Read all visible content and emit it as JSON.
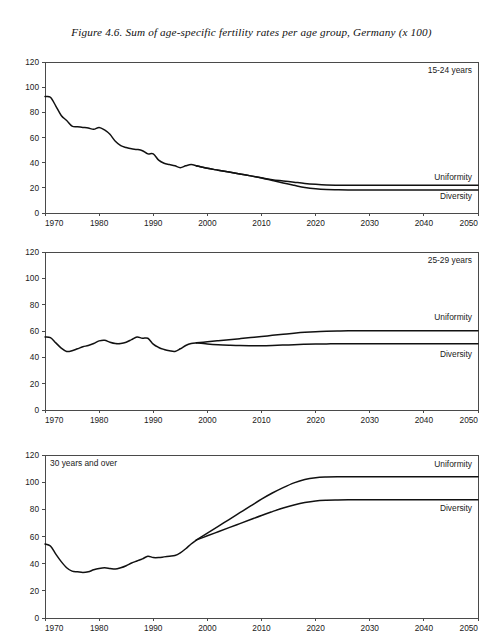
{
  "figure": {
    "title": "Figure 4.6.  Sum of age-specific fertility rates per age group, Germany (x 100)",
    "background_color": "#ffffff",
    "line_color": "#111111",
    "axis_color": "#4a4a4a"
  },
  "chart_data": [
    {
      "type": "line",
      "title": "15-24 years",
      "panel_label": "15-24 years",
      "panel_label_position": "top-right",
      "xlabel": "",
      "ylabel": "",
      "xlim": [
        1970,
        2050
      ],
      "ylim": [
        0,
        120
      ],
      "ytick_labels": [
        "0",
        "20",
        "40",
        "60",
        "80",
        "100",
        "120"
      ],
      "yticks": [
        0,
        20,
        40,
        60,
        80,
        100,
        120
      ],
      "xtick_labels": [
        "1970",
        "1980",
        "1990",
        "2000",
        "2010",
        "2020",
        "2030",
        "2040",
        "2050"
      ],
      "xticks": [
        1970,
        1980,
        1990,
        2000,
        2010,
        2020,
        2030,
        2040,
        2050
      ],
      "grid": false,
      "legend_position": "inline-right",
      "series": [
        {
          "name": "Historical",
          "label": "",
          "x": [
            1970,
            1971,
            1972,
            1973,
            1974,
            1975,
            1976,
            1977,
            1978,
            1979,
            1980,
            1981,
            1982,
            1983,
            1984,
            1985,
            1986,
            1987,
            1988,
            1989,
            1990,
            1991,
            1992,
            1993,
            1994,
            1995,
            1996,
            1997,
            1998
          ],
          "values": [
            92.5,
            92.0,
            85.0,
            77.5,
            73.5,
            69.0,
            68.5,
            68.0,
            67.5,
            66.5,
            68.0,
            66.0,
            62.5,
            57.0,
            53.5,
            52.0,
            51.0,
            50.5,
            49.5,
            47.0,
            47.0,
            42.0,
            39.5,
            38.5,
            37.5,
            36.0,
            37.5,
            38.5,
            37.5
          ]
        },
        {
          "name": "Uniformity",
          "label": "Uniformity",
          "x": [
            1998,
            2000,
            2002,
            2004,
            2006,
            2008,
            2010,
            2012,
            2014,
            2016,
            2018,
            2020,
            2022,
            2024,
            2026,
            2030,
            2040,
            2050
          ],
          "values": [
            37.5,
            35.5,
            34.0,
            32.5,
            31.0,
            29.5,
            28.0,
            26.5,
            25.5,
            24.5,
            23.5,
            22.8,
            22.3,
            22.1,
            22.0,
            22.0,
            22.0,
            22.0
          ]
        },
        {
          "name": "Diversity",
          "label": "Diversity",
          "x": [
            1998,
            2000,
            2002,
            2004,
            2006,
            2008,
            2010,
            2012,
            2014,
            2016,
            2018,
            2020,
            2022,
            2024,
            2026,
            2030,
            2040,
            2050
          ],
          "values": [
            37.5,
            35.5,
            34.0,
            32.5,
            31.0,
            29.5,
            27.8,
            25.8,
            23.8,
            22.0,
            20.3,
            19.2,
            18.6,
            18.4,
            18.3,
            18.3,
            18.3,
            18.3
          ]
        }
      ],
      "series_label_values": {
        "Uniformity": 26,
        "Diversity": 11
      }
    },
    {
      "type": "line",
      "title": "25-29 years",
      "panel_label": "25-29 years",
      "panel_label_position": "top-right",
      "xlabel": "",
      "ylabel": "",
      "xlim": [
        1970,
        2050
      ],
      "ylim": [
        0,
        120
      ],
      "ytick_labels": [
        "0",
        "20",
        "40",
        "60",
        "80",
        "100",
        "120"
      ],
      "yticks": [
        0,
        20,
        40,
        60,
        80,
        100,
        120
      ],
      "xtick_labels": [
        "1970",
        "1980",
        "1990",
        "2000",
        "2010",
        "2020",
        "2030",
        "2040",
        "2050"
      ],
      "xticks": [
        1970,
        1980,
        1990,
        2000,
        2010,
        2020,
        2030,
        2040,
        2050
      ],
      "grid": false,
      "legend_position": "inline-right",
      "series": [
        {
          "name": "Historical",
          "label": "",
          "x": [
            1970,
            1971,
            1972,
            1973,
            1974,
            1975,
            1976,
            1977,
            1978,
            1979,
            1980,
            1981,
            1982,
            1983,
            1984,
            1985,
            1986,
            1987,
            1988,
            1989,
            1990,
            1991,
            1992,
            1993,
            1994,
            1995,
            1996,
            1997,
            1998
          ],
          "values": [
            55.5,
            55.0,
            51.0,
            47.0,
            44.5,
            45.0,
            46.5,
            48.0,
            49.0,
            50.5,
            52.5,
            53.0,
            51.5,
            50.5,
            50.5,
            51.5,
            53.5,
            55.5,
            54.5,
            54.5,
            50.0,
            47.5,
            46.0,
            45.0,
            44.5,
            46.5,
            49.0,
            50.5,
            51.0
          ]
        },
        {
          "name": "Uniformity",
          "label": "Uniformity",
          "x": [
            1998,
            2000,
            2002,
            2004,
            2006,
            2008,
            2010,
            2012,
            2014,
            2016,
            2018,
            2020,
            2022,
            2024,
            2026,
            2030,
            2040,
            2050
          ],
          "values": [
            51.0,
            51.8,
            52.6,
            53.4,
            54.2,
            55.0,
            55.8,
            56.7,
            57.5,
            58.3,
            59.0,
            59.5,
            59.8,
            60.0,
            60.1,
            60.2,
            60.2,
            60.2
          ]
        },
        {
          "name": "Diversity",
          "label": "Diversity",
          "x": [
            1998,
            2000,
            2002,
            2004,
            2006,
            2008,
            2010,
            2012,
            2014,
            2016,
            2018,
            2020,
            2022,
            2024,
            2026,
            2030,
            2040,
            2050
          ],
          "values": [
            51.0,
            50.2,
            49.6,
            49.2,
            48.9,
            48.8,
            48.8,
            49.0,
            49.3,
            49.6,
            49.9,
            50.1,
            50.2,
            50.3,
            50.3,
            50.3,
            50.3,
            50.3
          ]
        }
      ],
      "series_label_values": {
        "Uniformity": 68,
        "Diversity": 40
      }
    },
    {
      "type": "line",
      "title": "30 years and over",
      "panel_label": "30 years and over",
      "panel_label_position": "top-left",
      "xlabel": "",
      "ylabel": "",
      "xlim": [
        1970,
        2050
      ],
      "ylim": [
        0,
        120
      ],
      "ytick_labels": [
        "0",
        "20",
        "40",
        "60",
        "80",
        "100",
        "120"
      ],
      "yticks": [
        0,
        20,
        40,
        60,
        80,
        100,
        120
      ],
      "xtick_labels": [
        "1970",
        "1980",
        "1990",
        "2000",
        "2010",
        "2020",
        "2030",
        "2040",
        "2050"
      ],
      "xticks": [
        1970,
        1980,
        1990,
        2000,
        2010,
        2020,
        2030,
        2040,
        2050
      ],
      "grid": false,
      "legend_position": "inline-right",
      "series": [
        {
          "name": "Historical",
          "label": "",
          "x": [
            1970,
            1971,
            1972,
            1973,
            1974,
            1975,
            1976,
            1977,
            1978,
            1979,
            1980,
            1981,
            1982,
            1983,
            1984,
            1985,
            1986,
            1987,
            1988,
            1989,
            1990,
            1991,
            1992,
            1993,
            1994,
            1995,
            1996,
            1997,
            1998
          ],
          "values": [
            54.5,
            53.0,
            47.0,
            41.5,
            37.0,
            34.5,
            34.0,
            33.5,
            34.0,
            35.5,
            36.5,
            37.0,
            36.5,
            36.0,
            37.0,
            38.5,
            40.5,
            42.0,
            43.5,
            45.5,
            44.5,
            44.5,
            45.0,
            45.5,
            46.0,
            48.0,
            51.0,
            54.5,
            57.5
          ]
        },
        {
          "name": "Uniformity",
          "label": "Uniformity",
          "x": [
            1998,
            2000,
            2002,
            2004,
            2006,
            2008,
            2010,
            2012,
            2014,
            2016,
            2018,
            2020,
            2022,
            2024,
            2026,
            2030,
            2040,
            2050
          ],
          "values": [
            57.5,
            62.5,
            67.5,
            72.5,
            77.5,
            82.5,
            87.5,
            92.0,
            96.0,
            99.5,
            102.0,
            103.3,
            103.8,
            104.0,
            104.0,
            104.0,
            104.0,
            104.0
          ]
        },
        {
          "name": "Diversity",
          "label": "Diversity",
          "x": [
            1998,
            2000,
            2002,
            2004,
            2006,
            2008,
            2010,
            2012,
            2014,
            2016,
            2018,
            2020,
            2022,
            2024,
            2026,
            2030,
            2040,
            2050
          ],
          "values": [
            57.5,
            60.5,
            63.5,
            66.5,
            69.5,
            72.5,
            75.5,
            78.3,
            81.0,
            83.2,
            85.0,
            86.2,
            86.7,
            86.9,
            87.0,
            87.0,
            87.0,
            87.0
          ]
        }
      ],
      "series_label_values": {
        "Uniformity": 111,
        "Diversity": 79
      }
    }
  ]
}
